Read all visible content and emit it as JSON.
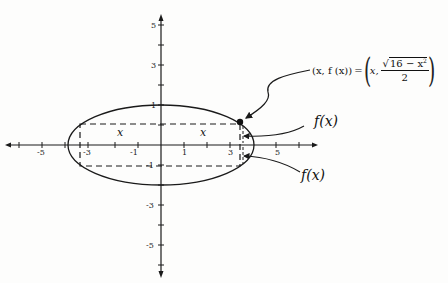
{
  "diagram": {
    "axes": {
      "x_tick_labels": [
        "-5",
        "-3",
        "-1",
        "1",
        "3",
        "5"
      ],
      "y_tick_labels": [
        "5",
        "3",
        "1",
        "-1",
        "-3",
        "-5"
      ]
    },
    "ellipse": {
      "semi_major_x": 4,
      "semi_minor_y": 2
    },
    "rectangle_labels": {
      "left_x": "x",
      "right_x": "x"
    },
    "point_annotation": {
      "lhs": "(x, f (x))",
      "equals": "=",
      "rhs_x": "x,",
      "numerator_sqrt": "16 − x",
      "numerator_exp": "2",
      "denominator": "2"
    },
    "fx_label_upper": "f(x)",
    "fx_label_lower": "f(x)",
    "colors": {
      "stroke": "#1a1a1a",
      "background": "#fdfdfc"
    }
  }
}
